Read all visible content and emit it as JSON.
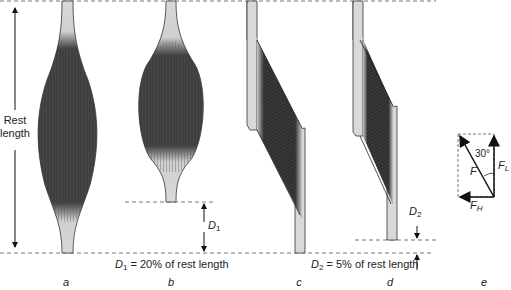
{
  "figure": {
    "rest_length_label_line1": "Rest",
    "rest_length_label_line2": "length",
    "panels": [
      {
        "id": "a",
        "label": "a",
        "description": "fusiform muscle at rest length"
      },
      {
        "id": "b",
        "label": "b",
        "description": "fusiform muscle contracted"
      },
      {
        "id": "c",
        "label": "c",
        "description": "pennate muscle at rest length"
      },
      {
        "id": "d",
        "label": "d",
        "description": "pennate muscle contracted"
      },
      {
        "id": "e",
        "label": "e",
        "description": "force vector decomposition"
      }
    ],
    "d1": {
      "symbol": "D",
      "subscript": "1",
      "caption_eq": " = 20% of rest length"
    },
    "d2": {
      "symbol": "D",
      "subscript": "2",
      "caption_eq": " = 5% of rest length"
    },
    "vector": {
      "angle_label": "30°",
      "force_label": "F",
      "f_l_symbol": "F",
      "f_l_sub": "L",
      "f_h_symbol": "F",
      "f_h_sub": "H"
    },
    "colors": {
      "muscle_dark": "#3a3a3a",
      "tendon_light": "#d9d9d9",
      "outline": "#333333",
      "dash": "#777777"
    }
  }
}
